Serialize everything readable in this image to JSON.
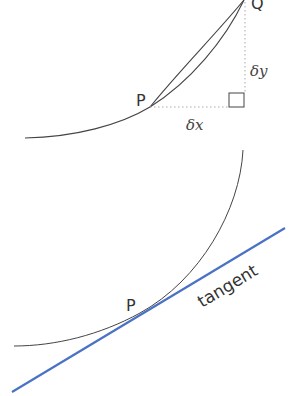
{
  "top_diagram": {
    "point_p_label": "P",
    "point_q_label": "Q",
    "delta_x_label": "δx",
    "delta_y_label": "δy"
  },
  "bottom_diagram": {
    "point_p_label": "P",
    "tangent_label": "tangent"
  },
  "colors": {
    "curve": "#444444",
    "tangent": "#4a72c4",
    "dotted": "#aaaaaa"
  }
}
